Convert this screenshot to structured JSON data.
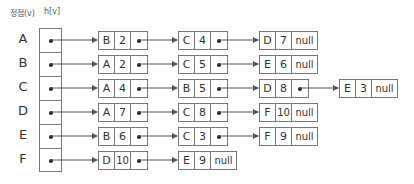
{
  "header": {
    "vertex_label": "정점(v)",
    "head_label": "h[v]"
  },
  "null_label": "null",
  "colors": {
    "line": "#555555",
    "border": "#777777",
    "text": "#333333"
  },
  "rows": [
    {
      "vertex": "A",
      "nodes": [
        {
          "v": "B",
          "w": "2"
        },
        {
          "v": "C",
          "w": "4"
        },
        {
          "v": "D",
          "w": "7"
        }
      ]
    },
    {
      "vertex": "B",
      "nodes": [
        {
          "v": "A",
          "w": "2"
        },
        {
          "v": "C",
          "w": "5"
        },
        {
          "v": "E",
          "w": "6"
        }
      ]
    },
    {
      "vertex": "C",
      "nodes": [
        {
          "v": "A",
          "w": "4"
        },
        {
          "v": "B",
          "w": "5"
        },
        {
          "v": "D",
          "w": "8"
        },
        {
          "v": "E",
          "w": "3"
        }
      ]
    },
    {
      "vertex": "D",
      "nodes": [
        {
          "v": "A",
          "w": "7"
        },
        {
          "v": "C",
          "w": "8"
        },
        {
          "v": "F",
          "w": "10"
        }
      ]
    },
    {
      "vertex": "E",
      "nodes": [
        {
          "v": "B",
          "w": "6"
        },
        {
          "v": "C",
          "w": "3"
        },
        {
          "v": "F",
          "w": "9"
        }
      ]
    },
    {
      "vertex": "F",
      "nodes": [
        {
          "v": "D",
          "w": "10"
        },
        {
          "v": "E",
          "w": "9"
        }
      ]
    }
  ]
}
